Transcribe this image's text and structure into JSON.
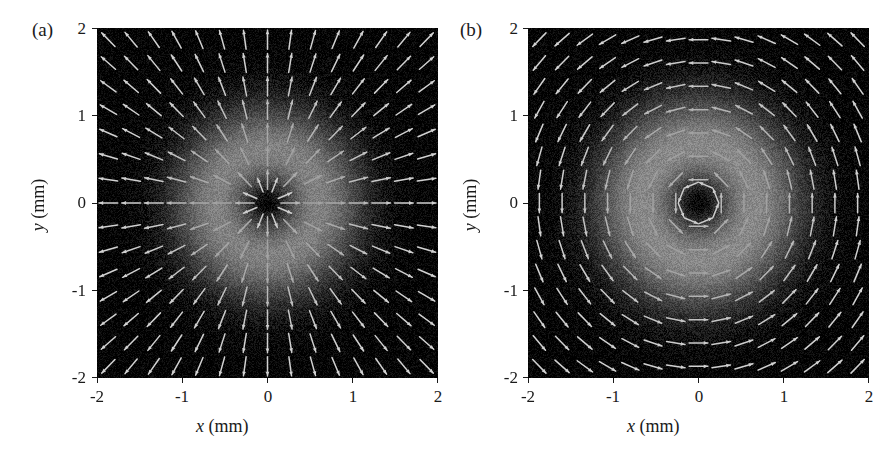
{
  "figure": {
    "background_color": "#ffffff",
    "foreground_color": "#1a1a1a",
    "panel_count": 2
  },
  "panels": [
    {
      "tag": "(a)",
      "xlabel_var": "x",
      "xlabel_unit": "(mm)",
      "ylabel_var": "y",
      "ylabel_unit": "(mm)",
      "xticks": [
        "-2",
        "-1",
        "0",
        "1",
        "2"
      ],
      "yticks": [
        "2",
        "1",
        "0",
        "-1",
        "-2"
      ]
    },
    {
      "tag": "(b)",
      "xlabel_var": "x",
      "xlabel_unit": "(mm)",
      "ylabel_var": "y",
      "ylabel_unit": "(mm)",
      "xticks": [
        "-2",
        "-1",
        "0",
        "1",
        "2"
      ],
      "yticks": [
        "2",
        "1",
        "0",
        "-1",
        "-2"
      ]
    }
  ],
  "chart_data": [
    {
      "type": "heatmap",
      "panel": "(a)",
      "title": "",
      "xlabel": "x (mm)",
      "ylabel": "y (mm)",
      "xlim": [
        -2,
        2
      ],
      "ylim": [
        -2,
        2
      ],
      "xticks": [
        -2,
        -1,
        0,
        1,
        2
      ],
      "yticks": [
        -2,
        -1,
        0,
        1,
        2
      ],
      "grid": false,
      "legend": "none",
      "colormap": "gray",
      "colormap_low": "#000000",
      "colormap_high": "#ffffff",
      "intensity_model": "donut",
      "intensity_description": "Annular (doughnut) intensity: dark null at r=0, bright ring peaking near r=0.95 mm, falling to dark beyond r=1.8 mm",
      "intensity_peak_radius_mm": 0.95,
      "intensity_ring_width_mm": 0.62,
      "intensity_center_value": 0.0,
      "intensity_max_value": 1.0,
      "vector_overlay": {
        "field_type": "radial",
        "description": "Arrows point radially outward from the beam centre; linear polarization orientation is along the local radius",
        "grid_nx": 15,
        "grid_ny": 15,
        "arrow_color": "#c8c8c8",
        "arrow_scale_mm": 0.22,
        "sample_vectors": [
          {
            "x": -1.0,
            "y": 0.0,
            "u": -1.0,
            "v": 0.0
          },
          {
            "x": 1.0,
            "y": 0.0,
            "u": 1.0,
            "v": 0.0
          },
          {
            "x": 0.0,
            "y": 1.0,
            "u": 0.0,
            "v": 1.0
          },
          {
            "x": 0.0,
            "y": -1.0,
            "u": 0.0,
            "v": -1.0
          },
          {
            "x": 0.71,
            "y": 0.71,
            "u": 0.71,
            "v": 0.71
          },
          {
            "x": -0.71,
            "y": 0.71,
            "u": -0.71,
            "v": 0.71
          },
          {
            "x": -0.71,
            "y": -0.71,
            "u": -0.71,
            "v": -0.71
          },
          {
            "x": 0.71,
            "y": -0.71,
            "u": 0.71,
            "v": -0.71
          }
        ]
      }
    },
    {
      "type": "heatmap",
      "panel": "(b)",
      "title": "",
      "xlabel": "x (mm)",
      "ylabel": "y (mm)",
      "xlim": [
        -2,
        2
      ],
      "ylim": [
        -2,
        2
      ],
      "xticks": [
        -2,
        -1,
        0,
        1,
        2
      ],
      "yticks": [
        -2,
        -1,
        0,
        1,
        2
      ],
      "grid": false,
      "legend": "none",
      "colormap": "gray",
      "colormap_low": "#000000",
      "colormap_high": "#ffffff",
      "intensity_model": "donut",
      "intensity_description": "Annular (doughnut) intensity: dark null at r=0, bright ring peaking near r=1.00 mm, falling to dark beyond r=1.9 mm",
      "intensity_peak_radius_mm": 1.0,
      "intensity_ring_width_mm": 0.68,
      "intensity_center_value": 0.0,
      "intensity_max_value": 1.0,
      "vector_overlay": {
        "field_type": "azimuthal",
        "description": "Arrows point tangentially, circulating counter-clockwise about the beam centre; linear polarization orientation is perpendicular to the local radius",
        "grid_nx": 15,
        "grid_ny": 15,
        "arrow_color": "#c8c8c8",
        "arrow_scale_mm": 0.22,
        "sample_vectors": [
          {
            "x": -1.0,
            "y": 0.0,
            "u": 0.0,
            "v": -1.0
          },
          {
            "x": 1.0,
            "y": 0.0,
            "u": 0.0,
            "v": 1.0
          },
          {
            "x": 0.0,
            "y": 1.0,
            "u": -1.0,
            "v": 0.0
          },
          {
            "x": 0.0,
            "y": -1.0,
            "u": 1.0,
            "v": 0.0
          },
          {
            "x": 0.71,
            "y": 0.71,
            "u": -0.71,
            "v": 0.71
          },
          {
            "x": -0.71,
            "y": 0.71,
            "u": -0.71,
            "v": -0.71
          },
          {
            "x": -0.71,
            "y": -0.71,
            "u": 0.71,
            "v": -0.71
          },
          {
            "x": 0.71,
            "y": -0.71,
            "u": 0.71,
            "v": 0.71
          }
        ]
      }
    }
  ]
}
